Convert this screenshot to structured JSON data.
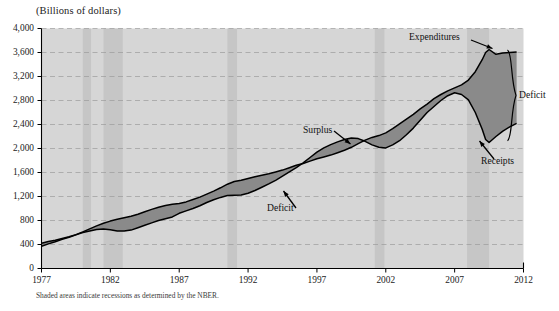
{
  "figure": {
    "axis_title": "(Billions of dollars)",
    "footnote": "Shaded areas indicate recessions as determined by the NBER."
  },
  "annotations": {
    "expenditures": "Expenditures",
    "receipts": "Receipts",
    "surplus": "Surplus",
    "deficit_mid": "Deficit",
    "deficit_brace": "Deficit"
  },
  "colors": {
    "plot_background": "#d6d6d6",
    "recession_band": "#c6c6c6",
    "gap_fill": "#8a8a8a",
    "line": "#000000",
    "gridline": "#9a9a9a",
    "axis": "#000000",
    "page_background": "#ffffff"
  },
  "chart_data": {
    "type": "area",
    "title": "",
    "subtitle": "",
    "xlabel": "",
    "ylabel": "(Billions of dollars)",
    "xlim": [
      1977,
      2012
    ],
    "ylim": [
      0,
      4000
    ],
    "ytick_labels": [
      "0",
      "400",
      "800",
      "1,200",
      "1,600",
      "2,000",
      "2,400",
      "2,800",
      "3,200",
      "3,600",
      "4,000"
    ],
    "yticks": [
      0,
      400,
      800,
      1200,
      1600,
      2000,
      2400,
      2800,
      3200,
      3600,
      4000
    ],
    "xtick_labels": [
      "1977",
      "1982",
      "1987",
      "1992",
      "1997",
      "2002",
      "2007",
      "2012"
    ],
    "xticks": [
      1977,
      1982,
      1987,
      1992,
      1997,
      2002,
      2007,
      2012
    ],
    "grid": true,
    "legend_position": "inline-annotations",
    "x": [
      1977.0,
      1977.5,
      1978.0,
      1978.5,
      1979.0,
      1979.5,
      1980.0,
      1980.5,
      1981.0,
      1981.5,
      1982.0,
      1982.5,
      1983.0,
      1983.5,
      1984.0,
      1984.5,
      1985.0,
      1985.5,
      1986.0,
      1986.5,
      1987.0,
      1987.5,
      1988.0,
      1988.5,
      1989.0,
      1989.5,
      1990.0,
      1990.5,
      1991.0,
      1991.5,
      1992.0,
      1992.5,
      1993.0,
      1993.5,
      1994.0,
      1994.5,
      1995.0,
      1995.5,
      1996.0,
      1996.5,
      1997.0,
      1997.5,
      1998.0,
      1998.5,
      1999.0,
      1999.5,
      2000.0,
      2000.5,
      2001.0,
      2001.5,
      2002.0,
      2002.5,
      2003.0,
      2003.5,
      2004.0,
      2004.5,
      2005.0,
      2005.5,
      2006.0,
      2006.5,
      2007.0,
      2007.5,
      2008.0,
      2008.5,
      2009.0,
      2009.25,
      2009.5,
      2010.0,
      2010.5,
      2011.0,
      2011.5
    ],
    "series": [
      {
        "name": "Expenditures",
        "values": [
          420,
          450,
          470,
          500,
          530,
          565,
          610,
          660,
          710,
          755,
          790,
          820,
          845,
          870,
          905,
          945,
          985,
          1020,
          1050,
          1070,
          1085,
          1110,
          1150,
          1190,
          1240,
          1290,
          1345,
          1405,
          1450,
          1470,
          1500,
          1530,
          1555,
          1580,
          1610,
          1640,
          1680,
          1720,
          1750,
          1790,
          1830,
          1860,
          1890,
          1930,
          1970,
          2020,
          2080,
          2140,
          2185,
          2215,
          2260,
          2330,
          2410,
          2490,
          2570,
          2660,
          2740,
          2830,
          2900,
          2960,
          3010,
          3060,
          3140,
          3280,
          3480,
          3600,
          3650,
          3570,
          3590,
          3600,
          3610
        ]
      },
      {
        "name": "Receipts",
        "values": [
          370,
          410,
          445,
          485,
          520,
          560,
          600,
          625,
          650,
          660,
          645,
          625,
          625,
          640,
          680,
          720,
          760,
          800,
          830,
          860,
          920,
          960,
          1000,
          1045,
          1100,
          1145,
          1185,
          1215,
          1220,
          1225,
          1255,
          1300,
          1355,
          1410,
          1470,
          1540,
          1610,
          1680,
          1760,
          1850,
          1940,
          2010,
          2065,
          2110,
          2150,
          2175,
          2165,
          2120,
          2060,
          2020,
          2010,
          2060,
          2130,
          2230,
          2340,
          2470,
          2600,
          2700,
          2800,
          2880,
          2930,
          2900,
          2810,
          2600,
          2320,
          2150,
          2100,
          2200,
          2290,
          2360,
          2420
        ]
      }
    ],
    "recessions": [
      {
        "start": 1980.0,
        "end": 1980.6
      },
      {
        "start": 1981.5,
        "end": 1982.9
      },
      {
        "start": 1990.5,
        "end": 1991.2
      },
      {
        "start": 2001.2,
        "end": 2001.9
      },
      {
        "start": 2007.9,
        "end": 2009.5
      }
    ]
  }
}
